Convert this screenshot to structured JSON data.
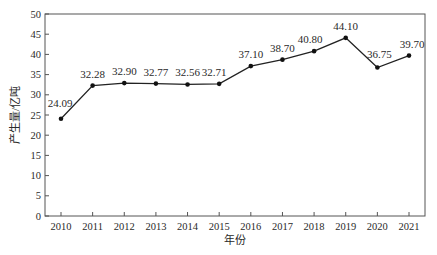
{
  "chart_data": {
    "type": "line",
    "title": "",
    "xlabel": "年份",
    "ylabel": "产生量/亿吨",
    "categories": [
      "2010",
      "2011",
      "2012",
      "2013",
      "2014",
      "2015",
      "2016",
      "2017",
      "2018",
      "2019",
      "2020",
      "2021"
    ],
    "series": [
      {
        "name": "产生量",
        "values": [
          24.09,
          32.28,
          32.9,
          32.77,
          32.56,
          32.71,
          37.1,
          38.7,
          40.8,
          44.1,
          36.75,
          39.7
        ],
        "labels": [
          "24.09",
          "32.28",
          "32.90",
          "32.77",
          "32.56",
          "32.71",
          "37.10",
          "38.70",
          "40.80",
          "44.10",
          "36.75",
          "39.70"
        ]
      }
    ],
    "ylim": [
      0,
      50
    ],
    "yticks": [
      "0",
      "5",
      "10",
      "15",
      "20",
      "25",
      "30",
      "35",
      "40",
      "45",
      "50"
    ],
    "grid": false,
    "legend": "none",
    "colors": {
      "line": "#222222",
      "marker": "#111111",
      "axis": "#555555"
    }
  }
}
